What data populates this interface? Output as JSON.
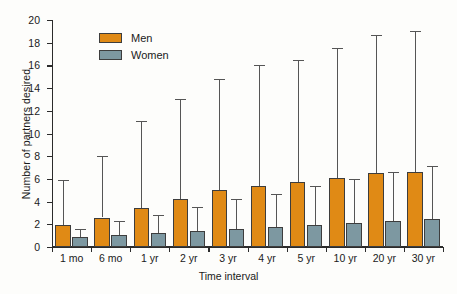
{
  "chart_data": {
    "type": "bar",
    "title": "",
    "xlabel": "Time interval",
    "ylabel": "Number of partners desired",
    "ylim": [
      0,
      20
    ],
    "ytick_step": 2,
    "yticks": [
      0,
      2,
      4,
      6,
      8,
      10,
      12,
      14,
      16,
      18,
      20
    ],
    "grid": false,
    "legend_position": "upper-left-inside",
    "categories": [
      "1 mo",
      "6 mo",
      "1 yr",
      "2 yr",
      "3 yr",
      "4 yr",
      "5 yr",
      "10 yr",
      "20 yr",
      "30 yr"
    ],
    "series": [
      {
        "name": "Men",
        "color": "#e08a15",
        "values": [
          1.9,
          2.6,
          3.4,
          4.25,
          5.0,
          5.35,
          5.7,
          6.05,
          6.5,
          6.65
        ],
        "error_upper": [
          5.9,
          8.0,
          11.1,
          13.0,
          14.8,
          16.0,
          16.5,
          17.5,
          18.7,
          19.0
        ]
      },
      {
        "name": "Women",
        "color": "#7d98a1",
        "values": [
          0.85,
          1.05,
          1.2,
          1.45,
          1.6,
          1.8,
          1.9,
          2.15,
          2.3,
          2.45
        ],
        "error_upper": [
          1.6,
          2.3,
          2.8,
          3.5,
          4.2,
          4.65,
          5.35,
          5.95,
          6.65,
          7.1
        ]
      }
    ]
  },
  "legend": {
    "items": [
      {
        "label": "Men",
        "color": "#e08a15"
      },
      {
        "label": "Women",
        "color": "#7d98a1"
      }
    ]
  },
  "axes": {
    "y_title": "Number of partners desired",
    "x_title": "Time interval"
  }
}
